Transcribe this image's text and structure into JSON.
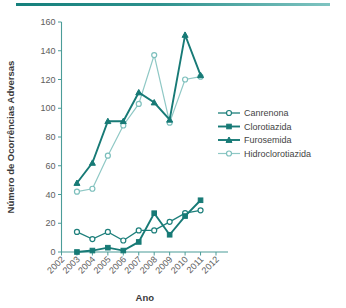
{
  "figure": {
    "top_rule_color": "#15807c",
    "background_color": "#ffffff"
  },
  "chart_data": {
    "type": "line",
    "title": "",
    "subtitle": "",
    "xlabel": "Ano",
    "ylabel": "Número de Ocorrências Adversas",
    "x": [
      2002,
      2003,
      2004,
      2005,
      2006,
      2007,
      2008,
      2009,
      2010,
      2011,
      2012
    ],
    "xtick_labels": [
      "2002",
      "2003",
      "2004",
      "2005",
      "2006",
      "2007",
      "2008",
      "2009",
      "2010",
      "2011",
      "2012"
    ],
    "ytick_labels": [
      "0",
      "20",
      "40",
      "60",
      "80",
      "100",
      "120",
      "140",
      "160"
    ],
    "ytick_values": [
      0,
      20,
      40,
      60,
      80,
      100,
      120,
      140,
      160
    ],
    "ylim": [
      0,
      160
    ],
    "xlim": [
      2002,
      2012
    ],
    "grid": false,
    "legend_position": "right",
    "series": [
      {
        "name": "Canrenona",
        "marker": "open-circle",
        "color": "#1d7f7b",
        "x": [
          2003,
          2004,
          2005,
          2006,
          2007,
          2008,
          2009,
          2010,
          2011
        ],
        "values": [
          14,
          9,
          14,
          8,
          15,
          15,
          21,
          27,
          29
        ]
      },
      {
        "name": "Clorotiazida",
        "marker": "filled-square",
        "color": "#177a76",
        "x": [
          2003,
          2004,
          2005,
          2006,
          2007,
          2008,
          2009,
          2010,
          2011
        ],
        "values": [
          0,
          1,
          3,
          1,
          7,
          27,
          12,
          25,
          36
        ]
      },
      {
        "name": "Furosemida",
        "marker": "filled-triangle",
        "color": "#177a76",
        "x": [
          2003,
          2004,
          2005,
          2006,
          2007,
          2008,
          2009,
          2010,
          2011
        ],
        "values": [
          48,
          62,
          91,
          91,
          111,
          104,
          92,
          151,
          123
        ]
      },
      {
        "name": "Hidroclorotiazida",
        "marker": "open-circle",
        "color": "#8fc8c5",
        "x": [
          2003,
          2004,
          2005,
          2006,
          2007,
          2008,
          2009,
          2010,
          2011
        ],
        "values": [
          42,
          44,
          67,
          88,
          103,
          137,
          90,
          120,
          122
        ]
      }
    ]
  }
}
